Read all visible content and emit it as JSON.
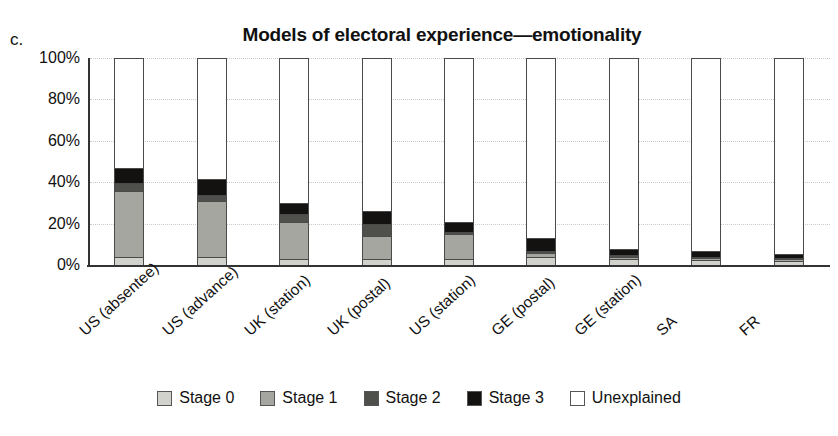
{
  "panel_label": "c.",
  "chart_data": {
    "type": "bar",
    "title": "Models of electoral experience—emotionality",
    "xlabel": "",
    "ylabel": "",
    "ylim": [
      0,
      100
    ],
    "stacked": true,
    "normalized_percent": true,
    "grid": true,
    "legend_position": "bottom",
    "ytick_labels": [
      "0%",
      "20%",
      "40%",
      "60%",
      "80%",
      "100%"
    ],
    "ytick_values": [
      0,
      20,
      40,
      60,
      80,
      100
    ],
    "categories": [
      "US (absentee)",
      "US (advance)",
      "UK (station)",
      "UK (postal)",
      "US (station)",
      "GE (postal)",
      "GE (station)",
      "SA",
      "FR"
    ],
    "series": [
      {
        "name": "Stage 0",
        "color": "#d2d2cd",
        "values": [
          4,
          4,
          3,
          3,
          3,
          4,
          3,
          2.5,
          2
        ]
      },
      {
        "name": "Stage 1",
        "color": "#a6a6a0",
        "values": [
          32,
          27,
          18,
          11,
          12,
          2,
          1,
          1,
          1
        ]
      },
      {
        "name": "Stage 2",
        "color": "#4f4f4b",
        "values": [
          4,
          3,
          4,
          6,
          1,
          1,
          1,
          0.5,
          0.5
        ]
      },
      {
        "name": "Stage 3",
        "color": "#141210",
        "values": [
          7,
          8,
          5,
          6,
          5,
          6,
          3,
          3,
          2
        ]
      },
      {
        "name": "Unexplained",
        "color": "#ffffff",
        "values": [
          53,
          58,
          70,
          74,
          79,
          87,
          92,
          93,
          94.5
        ]
      }
    ]
  }
}
